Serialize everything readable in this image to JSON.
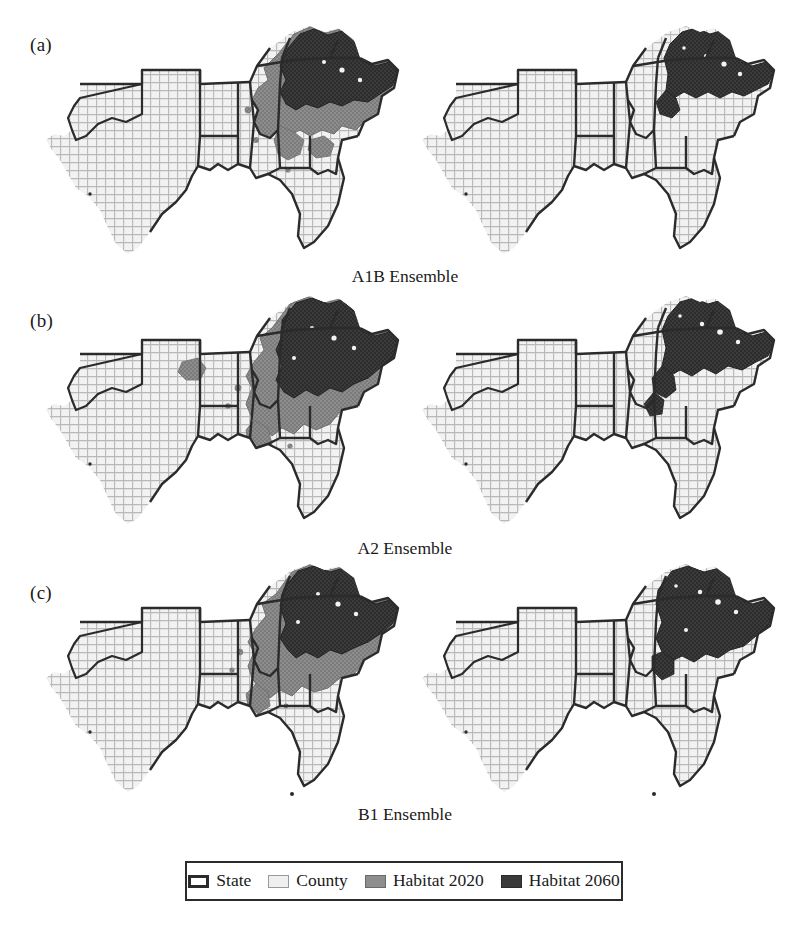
{
  "figure": {
    "panels": [
      {
        "label": "(a)",
        "caption": "A1B Ensemble"
      },
      {
        "label": "(b)",
        "caption": "A2 Ensemble"
      },
      {
        "label": "(c)",
        "caption": "B1 Ensemble"
      }
    ],
    "legend": {
      "items": [
        {
          "label": "State",
          "swatch": "state-swatch",
          "color": "#ffffff"
        },
        {
          "label": "County",
          "swatch": "county-swatch",
          "color": "#efefef"
        },
        {
          "label": "Habitat 2020",
          "swatch": "habitat-2020-swatch",
          "color": "#8e8e8e"
        },
        {
          "label": "Habitat 2060",
          "swatch": "habitat-2060-swatch",
          "color": "#3a3a3a"
        }
      ]
    },
    "map_columns": [
      "2020",
      "2060"
    ],
    "region": "Southeastern United States",
    "states": [
      "Texas",
      "Oklahoma",
      "Louisiana",
      "Arkansas",
      "Mississippi",
      "Alabama",
      "Georgia",
      "Florida",
      "Tennessee",
      "Kentucky",
      "South Carolina",
      "North Carolina",
      "Virginia"
    ]
  }
}
